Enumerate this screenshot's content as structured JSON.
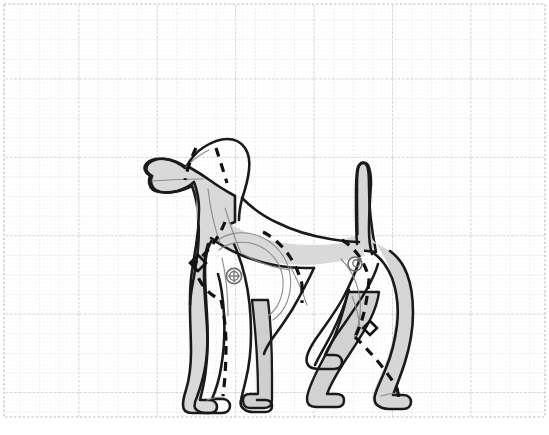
{
  "canvas": {
    "width": 549,
    "height": 435,
    "background_color": "#ffffff",
    "title": "Dog Anatomy Side View Diagram"
  },
  "grid": {
    "name": "graph-paper-grid",
    "style": "dotted",
    "minor_spacing": 19.6,
    "major_spacing": 19.6,
    "minor_color": "#d8d8d8",
    "major_color": "#b9b9b9",
    "fine_dot_color": "#ececec",
    "fine_spacing": 3.92,
    "columns": 28,
    "rows": 22,
    "border": {
      "visible": true,
      "color": "#b9b9b9",
      "left_x": 4,
      "top_y": 4,
      "right_x": 545,
      "bottom_y": 417
    }
  },
  "figure": {
    "name": "dog-side-view",
    "view": "lateral-left-facing",
    "body_fill": "#d6d6d6",
    "body_fill_light": "#dedede",
    "outline_color": "#1a1a1a",
    "outline_width": 2.6,
    "interior_line_color": "#8c8c8c",
    "interior_line_width": 1.1,
    "dash_line_color": "#111111",
    "dash_line_width": 3.2,
    "dash_pattern": "9,7",
    "bounds": {
      "x": 145,
      "y": 128,
      "width": 295,
      "height": 288
    }
  },
  "body_parts": [
    {
      "name": "head",
      "label": "Head"
    },
    {
      "name": "muzzle",
      "label": "Muzzle"
    },
    {
      "name": "ear",
      "label": "Ear"
    },
    {
      "name": "neck",
      "label": "Neck"
    },
    {
      "name": "chest",
      "label": "Chest"
    },
    {
      "name": "shoulder",
      "label": "Shoulder"
    },
    {
      "name": "ribcage",
      "label": "Ribcage"
    },
    {
      "name": "back",
      "label": "Back"
    },
    {
      "name": "loin",
      "label": "Loin"
    },
    {
      "name": "hip",
      "label": "Hip"
    },
    {
      "name": "tail",
      "label": "Tail"
    },
    {
      "name": "front-leg-near",
      "label": "Front Leg (near)"
    },
    {
      "name": "front-leg-far",
      "label": "Front Leg (far)"
    },
    {
      "name": "hind-leg-near",
      "label": "Hind Leg (near)"
    },
    {
      "name": "hind-leg-far",
      "label": "Hind Leg (far)"
    },
    {
      "name": "front-paw",
      "label": "Front Paw"
    },
    {
      "name": "hind-paw",
      "label": "Hind Paw"
    }
  ],
  "markers": {
    "joints": [
      {
        "name": "shoulder-joint-marker",
        "type": "crosshair-circle",
        "cx": 234,
        "cy": 276,
        "r_outer": 7.5,
        "r_inner": 4.5,
        "color": "#6e6e6e"
      },
      {
        "name": "hip-joint-marker",
        "type": "spiral-circle",
        "cx": 355,
        "cy": 264,
        "r_outer": 7.0,
        "r_inner": 4.0,
        "color": "#6e6e6e"
      }
    ],
    "diamonds": [
      {
        "name": "elbow-diamond-marker",
        "cx": 198,
        "cy": 263,
        "size": 9,
        "color": "#111111"
      },
      {
        "name": "stifle-diamond-marker",
        "cx": 369,
        "cy": 328,
        "size": 8,
        "color": "#111111"
      }
    ]
  },
  "guide_lines": {
    "name": "skeletal-dashed-guides",
    "description": "Dashed construction lines tracing the skeletal axes of the dog",
    "segments": [
      {
        "name": "ear-dash-left",
        "label": "Ear front edge"
      },
      {
        "name": "ear-dash-right",
        "label": "Ear rear edge"
      },
      {
        "name": "neck-spine-dash",
        "label": "Cervical spine axis"
      },
      {
        "name": "scapula-dash",
        "label": "Scapula line"
      },
      {
        "name": "humerus-dash",
        "label": "Humerus line"
      },
      {
        "name": "front-leg-dash",
        "label": "Front limb axis"
      },
      {
        "name": "rib-back-dash",
        "label": "Thoracolumbar line"
      },
      {
        "name": "abdomen-dash",
        "label": "Abdominal line"
      },
      {
        "name": "pelvis-dash",
        "label": "Pelvic line"
      },
      {
        "name": "femur-dash",
        "label": "Femur line"
      },
      {
        "name": "hind-leg-dash",
        "label": "Hind limb axis"
      }
    ]
  }
}
